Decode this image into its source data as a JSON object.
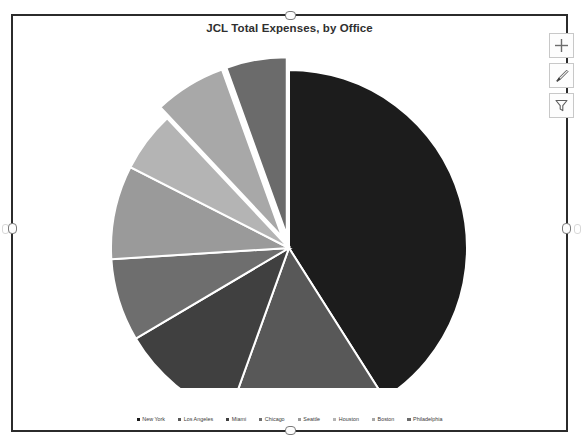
{
  "chart_data": {
    "type": "pie",
    "title": "JCL Total Expenses, by Office",
    "xlabel": "",
    "ylabel": "",
    "legend_position": "bottom",
    "grid": false,
    "categories": [
      "New York",
      "Los Angeles",
      "Miami",
      "Chicago",
      "Seattle",
      "Houston",
      "Boston",
      "Philadelphia"
    ],
    "values": [
      41.0,
      14.5,
      11.0,
      7.5,
      8.5,
      5.5,
      6.5,
      5.5
    ],
    "units": "percent of total expenses",
    "colors": [
      "#1c1c1c",
      "#585858",
      "#404040",
      "#6e6e6e",
      "#9a9a9a",
      "#b4b4b4",
      "#a8a8a8",
      "#6b6b6b"
    ],
    "exploded_slices": [
      "Boston",
      "Philadelphia"
    ],
    "series": [
      {
        "name": "JCL Total Expenses",
        "values": [
          41.0,
          14.5,
          11.0,
          7.5,
          8.5,
          5.5,
          6.5,
          5.5
        ]
      }
    ]
  },
  "chart": {
    "title": "JCL Total Expenses, by Office",
    "legend": [
      {
        "label": "New York",
        "color": "#1c1c1c"
      },
      {
        "label": "Los Angeles",
        "color": "#585858"
      },
      {
        "label": "Miami",
        "color": "#404040"
      },
      {
        "label": "Chicago",
        "color": "#6e6e6e"
      },
      {
        "label": "Seattle",
        "color": "#9a9a9a"
      },
      {
        "label": "Houston",
        "color": "#b4b4b4"
      },
      {
        "label": "Boston",
        "color": "#a8a8a8"
      },
      {
        "label": "Philadelphia",
        "color": "#6b6b6b"
      }
    ]
  },
  "chart_buttons": [
    {
      "name": "chart-elements",
      "icon": "plus-icon"
    },
    {
      "name": "chart-styles",
      "icon": "brush-icon"
    },
    {
      "name": "chart-filters",
      "icon": "funnel-icon"
    }
  ]
}
